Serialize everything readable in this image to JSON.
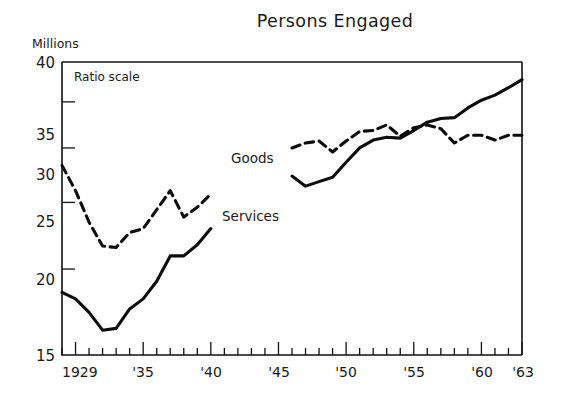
{
  "chart_data": {
    "type": "line",
    "title": "Persons Engaged",
    "subtitle": "",
    "xlabel": "",
    "ylabel": "Millions",
    "unit_label": "Millions",
    "annotation": "Ratio scale",
    "scale_note": "Ratio scale",
    "yscale": "log",
    "grid": false,
    "legend_position": "inline-labels",
    "ylim": [
      15,
      40
    ],
    "xlim": [
      1929,
      1963
    ],
    "ytick_labels": [
      "15",
      "20",
      "25",
      "30",
      "35",
      "40"
    ],
    "ytick_values": [
      15,
      20,
      25,
      30,
      35,
      40
    ],
    "xtick_labels": [
      "1929",
      "'35",
      "'40",
      "'45",
      "'50",
      "'55",
      "'60",
      "'63"
    ],
    "xtick_values": [
      1929,
      1935,
      1940,
      1945,
      1950,
      1955,
      1960,
      1963
    ],
    "x_minor_tick_interval": 1,
    "x_major_tick_interval": 5,
    "series": [
      {
        "name": "Goods",
        "label": "Goods",
        "style": "dashed",
        "color": "#0d0d0d",
        "segments": [
          {
            "x": [
              1929,
              1930,
              1931,
              1932,
              1933,
              1934,
              1935,
              1936,
              1937,
              1938,
              1939,
              1940
            ],
            "values": [
              28.3,
              26.0,
              23.4,
              21.6,
              21.5,
              22.6,
              22.9,
              24.4,
              26.0,
              23.8,
              24.6,
              25.7
            ]
          },
          {
            "x": [
              1946,
              1947,
              1948,
              1949,
              1950,
              1951,
              1952,
              1953,
              1954,
              1955,
              1956,
              1957,
              1958,
              1959,
              1960,
              1961,
              1962,
              1963
            ],
            "values": [
              30.0,
              30.5,
              30.7,
              29.6,
              30.7,
              31.7,
              31.8,
              32.4,
              31.2,
              32.1,
              32.4,
              32.0,
              30.5,
              31.3,
              31.3,
              30.8,
              31.3,
              31.3
            ]
          }
        ]
      },
      {
        "name": "Services",
        "label": "Services",
        "style": "solid",
        "color": "#0d0d0d",
        "segments": [
          {
            "x": [
              1929,
              1930,
              1931,
              1932,
              1933,
              1934,
              1935,
              1936,
              1937,
              1938,
              1939,
              1940
            ],
            "values": [
              18.5,
              18.1,
              17.3,
              16.3,
              16.4,
              17.5,
              18.1,
              19.2,
              20.9,
              20.9,
              21.7,
              22.9
            ]
          },
          {
            "x": [
              1946,
              1947,
              1948,
              1949,
              1950,
              1951,
              1952,
              1953,
              1954,
              1955,
              1956,
              1957,
              1958,
              1959,
              1960,
              1961,
              1962,
              1963
            ],
            "values": [
              27.3,
              26.4,
              26.8,
              27.2,
              28.6,
              30.0,
              30.8,
              31.1,
              31.0,
              31.8,
              32.7,
              33.1,
              33.2,
              34.3,
              35.2,
              35.8,
              36.7,
              37.7
            ]
          }
        ]
      }
    ]
  },
  "figure": {
    "title": "Persons Engaged",
    "unit_label": "Millions",
    "ratio_scale_note": "Ratio scale",
    "goods_label": "Goods",
    "services_label": "Services",
    "ytick_0": "15",
    "ytick_1": "20",
    "ytick_2": "25",
    "ytick_3": "30",
    "ytick_4": "35",
    "ytick_5": "40",
    "xtick_0": "1929",
    "xtick_1": "'35",
    "xtick_2": "'40",
    "xtick_3": "'45",
    "xtick_4": "'50",
    "xtick_5": "'55",
    "xtick_6": "'60",
    "xtick_7": "'63"
  }
}
